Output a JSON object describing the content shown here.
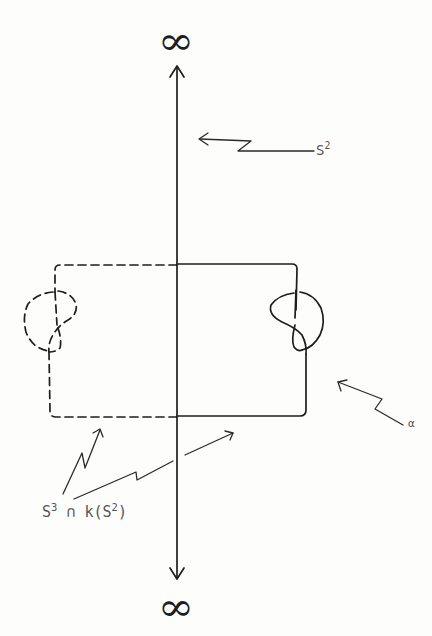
{
  "diagram": {
    "top_symbol": "∞",
    "bottom_symbol": "∞",
    "labels": {
      "sphere": {
        "base": "S",
        "exponent": "2"
      },
      "alpha": "α",
      "intersection": {
        "s_base": "S",
        "s_exp": "3",
        "cap": "∩",
        "k_open": "k(",
        "inner_base": "S",
        "inner_exp": "2",
        "close": ")"
      }
    },
    "elements": [
      "vertical axis with arrowheads pointing to ∞ at top and bottom",
      "rectangle loop: left half dashed with dashed trefoil knot, right half solid with solid knot",
      "arrow from S^2 label pointing to vertical axis",
      "arrow from α label pointing to right side of loop",
      "two arrows from S^3 ∩ k(S^2) label pointing to bottom edges of loop"
    ],
    "colors": {
      "ink": "#1e1e1e",
      "label": "#555555",
      "background": "#fdfdfc"
    }
  }
}
